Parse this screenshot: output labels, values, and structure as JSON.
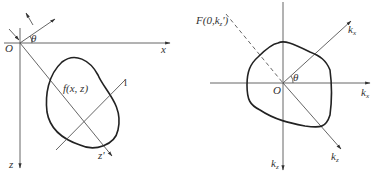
{
  "left_panel": {
    "origin_label": "O",
    "x_axis_label": "x",
    "z_axis_label": "z",
    "rotated_axis_label": "z'",
    "angle_label": "θ",
    "function_label": "f(x, z)",
    "line_label": "l"
  },
  "right_panel": {
    "origin_label": "O",
    "kx_label": "k",
    "kx_sub": "x",
    "kz_label": "k",
    "kz_sub": "z",
    "kx_prime_label": "k",
    "kx_prime_sub": "x",
    "kz_prime_label": "k",
    "kz_prime_sub": "z",
    "angle_label": "θ",
    "projection_label": "F(0,k",
    "projection_sub": "z",
    "projection_suffix": "')"
  }
}
